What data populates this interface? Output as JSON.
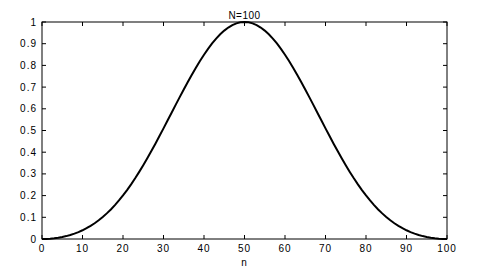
{
  "chart_data": {
    "type": "line",
    "title": "N=100",
    "xlabel": "n",
    "ylabel": "",
    "xlim": [
      0,
      100
    ],
    "ylim": [
      0,
      1
    ],
    "grid": false,
    "legend": null,
    "x_ticks": [
      "0",
      "10",
      "20",
      "30",
      "40",
      "50",
      "60",
      "70",
      "80",
      "90",
      "100"
    ],
    "y_ticks": [
      "0",
      "0.1",
      "0.2",
      "0.3",
      "0.4",
      "0.5",
      "0.6",
      "0.7",
      "0.8",
      "0.9",
      "1"
    ],
    "series": [
      {
        "name": "window w(n)",
        "color": "#000000",
        "x": [
          0,
          5,
          10,
          15,
          20,
          25,
          30,
          35,
          40,
          45,
          50,
          55,
          60,
          65,
          70,
          75,
          80,
          85,
          90,
          95,
          100
        ],
        "values": [
          0.0,
          0.01,
          0.04,
          0.11,
          0.2,
          0.34,
          0.51,
          0.68,
          0.85,
          0.96,
          1.0,
          0.96,
          0.85,
          0.68,
          0.51,
          0.34,
          0.2,
          0.11,
          0.04,
          0.01,
          0.0
        ]
      }
    ]
  },
  "plot": {
    "left": 42,
    "right": 447,
    "top": 22,
    "bottom": 239
  }
}
